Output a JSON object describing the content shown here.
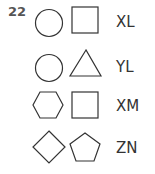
{
  "question_number": "22",
  "stroke_color": "#333333",
  "rows": [
    {
      "shapes": [
        "circle",
        "square"
      ],
      "label": "XL"
    },
    {
      "shapes": [
        "circle",
        "triangle"
      ],
      "label": "YL"
    },
    {
      "shapes": [
        "hexagon",
        "square"
      ],
      "label": "XM"
    },
    {
      "shapes": [
        "diamond",
        "pentagon"
      ],
      "label": "ZN"
    }
  ]
}
